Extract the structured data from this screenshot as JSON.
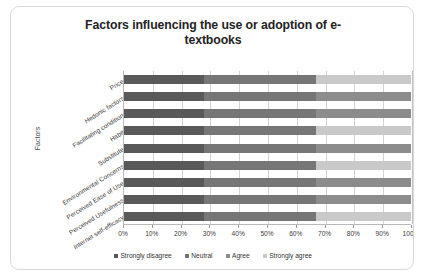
{
  "chart_data": {
    "type": "bar",
    "subtype": "100% stacked horizontal bar",
    "title": "Factors influencing the use or adoption of e-textbooks",
    "xlabel": "",
    "ylabel": "Factors",
    "xlim": [
      0,
      100
    ],
    "xticks": [
      "0%",
      "10%",
      "20%",
      "30%",
      "40%",
      "50%",
      "60%",
      "70%",
      "80%",
      "90%",
      "100%"
    ],
    "grid": true,
    "legend_position": "bottom",
    "categories": [
      "Price",
      "Hedonic factors",
      "Facilitating condition",
      "Habit",
      "Substitute",
      "Environmental Concerns",
      "Perceived Ease of Use",
      "Perceived Usefulness",
      "Internet self-efficacy"
    ],
    "series": [
      {
        "name": "Strongly disagree",
        "color": "#595959",
        "values": [
          28,
          28,
          28,
          28,
          28,
          28,
          28,
          28,
          28
        ]
      },
      {
        "name": "Neutral",
        "color": "#767676",
        "values": [
          39,
          39,
          39,
          39,
          39,
          39,
          39,
          39,
          39
        ]
      },
      {
        "name": "Agree",
        "color": "#8c8c8c",
        "values": [
          0,
          33,
          33,
          0,
          33,
          0,
          33,
          33,
          0
        ]
      },
      {
        "name": "Strongly agree",
        "color": "#c9c9c9",
        "values": [
          33,
          0,
          0,
          33,
          0,
          33,
          0,
          0,
          33
        ]
      }
    ]
  },
  "legend": {
    "items": [
      {
        "label": "Strongly disagree",
        "color": "#595959"
      },
      {
        "label": "Neutral",
        "color": "#767676"
      },
      {
        "label": "Agree",
        "color": "#8c8c8c"
      },
      {
        "label": "Strongly agree",
        "color": "#c9c9c9"
      }
    ]
  }
}
